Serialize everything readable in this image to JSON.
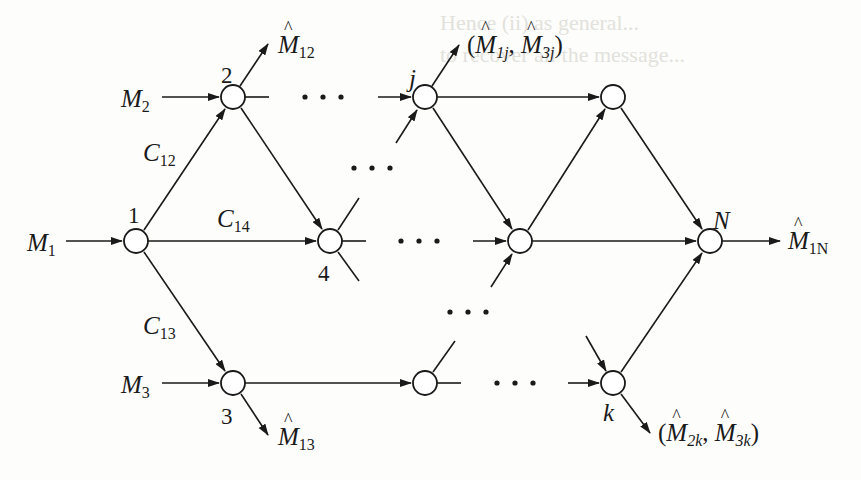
{
  "figure": {
    "type": "network-flow-diagram",
    "nodes": [
      {
        "id": "1",
        "label": "1",
        "cx": 136,
        "cy": 241
      },
      {
        "id": "2",
        "label": "2",
        "cx": 233,
        "cy": 97
      },
      {
        "id": "3",
        "label": "3",
        "cx": 233,
        "cy": 383
      },
      {
        "id": "4",
        "label": "4",
        "cx": 330,
        "cy": 241
      },
      {
        "id": "j",
        "label": "j",
        "cx": 425,
        "cy": 97
      },
      {
        "id": "t",
        "label": "",
        "cx": 613,
        "cy": 97
      },
      {
        "id": "m",
        "label": "",
        "cx": 520,
        "cy": 241
      },
      {
        "id": "b",
        "label": "",
        "cx": 425,
        "cy": 383
      },
      {
        "id": "k",
        "label": "k",
        "cx": 613,
        "cy": 383
      },
      {
        "id": "N",
        "label": "N",
        "cx": 710,
        "cy": 241
      }
    ],
    "node_radius": 12,
    "inputs": {
      "m1": {
        "text": "M",
        "sub": "1"
      },
      "m2": {
        "text": "M",
        "sub": "2"
      },
      "m3": {
        "text": "M",
        "sub": "3"
      }
    },
    "edge_labels": {
      "c12": {
        "text": "C",
        "sub": "12"
      },
      "c13": {
        "text": "C",
        "sub": "13"
      },
      "c14": {
        "text": "C",
        "sub": "14"
      }
    },
    "outputs": {
      "m12": {
        "text": "M",
        "sub": "12"
      },
      "m13": {
        "text": "M",
        "sub": "13"
      },
      "m1n": {
        "text": "M",
        "sub": "1N"
      },
      "mj": {
        "open": "(",
        "a": "M",
        "asub": "1j",
        "sep": ", ",
        "b": "M",
        "bsub": "3j",
        "close": ")"
      },
      "mk": {
        "open": "(",
        "a": "M",
        "asub": "2k",
        "sep": ", ",
        "b": "M",
        "bsub": "3k",
        "close": ")"
      }
    },
    "ellipsis": "· · ·",
    "node_labels": {
      "n1": "1",
      "n2": "2",
      "n3": "3",
      "n4": "4",
      "nj": "j",
      "nk": "k",
      "nN": "N"
    }
  },
  "background_bleed": {
    "line1": "Hence (ii) as general...",
    "line2": "to recover all the message..."
  }
}
